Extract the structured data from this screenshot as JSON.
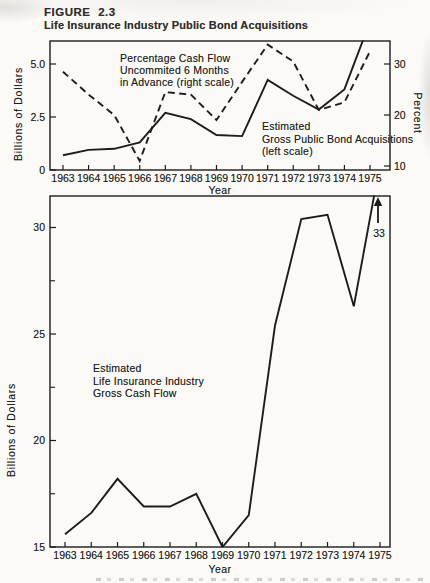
{
  "figure": {
    "number": "FIGURE 2.3",
    "title": "Life Insurance Industry Public Bond Acquisitions"
  },
  "colors": {
    "ink": "#1c1c1c",
    "paper": "#fbfaf7"
  },
  "chart_data": [
    {
      "id": "top-chart",
      "type": "line",
      "x": [
        1963,
        1964,
        1965,
        1966,
        1967,
        1968,
        1969,
        1970,
        1971,
        1972,
        1973,
        1974,
        1975
      ],
      "x_axis": {
        "label": "Year"
      },
      "left_axis": {
        "label": "Billions of Dollars",
        "ticks": [
          0,
          2.5,
          5.0
        ],
        "tick_labels": [
          "0",
          "2.5",
          "5.0"
        ],
        "range": [
          0,
          6.1
        ]
      },
      "right_axis": {
        "label": "Percent",
        "ticks": [
          10,
          20,
          30
        ],
        "tick_labels": [
          "10",
          "20",
          "30"
        ],
        "range": [
          10,
          34.5
        ]
      },
      "series": [
        {
          "name": "Percentage Cash Flow Uncommited 6 Months in Advance",
          "axis": "right",
          "style": "dashed",
          "values": [
            28.5,
            24,
            20,
            11,
            24.5,
            24,
            19,
            26.5,
            33.8,
            30.5,
            21,
            22.5,
            32.5
          ]
        },
        {
          "name": "Estimated Gross Public Bond Acquisitions",
          "axis": "left",
          "style": "solid",
          "values": [
            0.7,
            0.95,
            1.0,
            1.3,
            2.7,
            2.4,
            1.65,
            1.6,
            4.25,
            3.5,
            2.85,
            3.8,
            7.0
          ]
        }
      ],
      "annotations": [
        {
          "lines": [
            "Percentage Cash Flow",
            "Uncommited 6 Months",
            "in Advance (right scale)"
          ]
        },
        {
          "lines": [
            "Estimated",
            "Gross Public Bond Acquisitions",
            "(left scale)"
          ]
        }
      ]
    },
    {
      "id": "bottom-chart",
      "type": "line",
      "x": [
        1963,
        1964,
        1965,
        1966,
        1967,
        1968,
        1969,
        1970,
        1971,
        1972,
        1973,
        1974,
        1975
      ],
      "x_axis": {
        "label": "Year"
      },
      "left_axis": {
        "label": "Billions of Dollars",
        "ticks": [
          15,
          20,
          25,
          30
        ],
        "tick_labels": [
          "15",
          "20",
          "25",
          "30"
        ],
        "minor_ticks": [
          17.5,
          22.5,
          27.5
        ],
        "range": [
          15,
          31.5
        ]
      },
      "series": [
        {
          "name": "Estimated Life Insurance Industry Gross Cash Flow",
          "axis": "left",
          "style": "solid",
          "values": [
            15.6,
            16.6,
            18.2,
            16.9,
            16.9,
            17.5,
            15.0,
            16.5,
            25.4,
            30.4,
            30.6,
            26.3,
            33
          ]
        }
      ],
      "annotations": [
        {
          "lines": [
            "Estimated",
            "Life Insurance Industry",
            "Gross Cash Flow"
          ]
        },
        {
          "type": "arrow",
          "text": "33"
        }
      ]
    }
  ]
}
